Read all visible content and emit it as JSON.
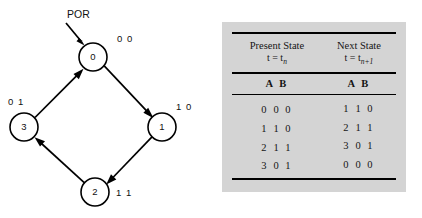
{
  "diagram": {
    "reset_label": "POR",
    "states": [
      {
        "id": "0",
        "outputs": "0 0",
        "cx": 93,
        "cy": 57,
        "r": 14,
        "label_x": 117,
        "label_y": 42
      },
      {
        "id": "1",
        "outputs": "1 0",
        "cx": 162,
        "cy": 127,
        "r": 14,
        "label_x": 176,
        "label_y": 110
      },
      {
        "id": "2",
        "outputs": "1 1",
        "cx": 95,
        "cy": 192,
        "r": 14,
        "label_x": 116,
        "label_y": 196
      },
      {
        "id": "3",
        "outputs": "0 1",
        "cx": 24,
        "cy": 127,
        "r": 14,
        "label_x": 8,
        "label_y": 105
      }
    ],
    "transitions": [
      {
        "from": "0",
        "to": "1"
      },
      {
        "from": "1",
        "to": "2"
      },
      {
        "from": "2",
        "to": "3"
      },
      {
        "from": "3",
        "to": "0"
      }
    ]
  },
  "table": {
    "present_state": {
      "title": "Present State",
      "time_prefix": "t = t",
      "time_subscript": "n"
    },
    "next_state": {
      "title": "Next State",
      "time_prefix": "t = t",
      "time_subscript": "n+1"
    },
    "column_headers": {
      "present_ab": "A B",
      "next_ab": "A B"
    },
    "rows": [
      {
        "present_num": "0",
        "present_bits": "0 0",
        "next_num": "1",
        "next_bits": "1 0"
      },
      {
        "present_num": "1",
        "present_bits": "1 0",
        "next_num": "2",
        "next_bits": "1 1"
      },
      {
        "present_num": "2",
        "present_bits": "1 1",
        "next_num": "3",
        "next_bits": "0 1"
      },
      {
        "present_num": "3",
        "present_bits": "0 1",
        "next_num": "0",
        "next_bits": "0 0"
      }
    ]
  },
  "colors": {
    "panel_background": "#d4d4d4",
    "page_background": "#ffffff",
    "ink": "#000000"
  }
}
